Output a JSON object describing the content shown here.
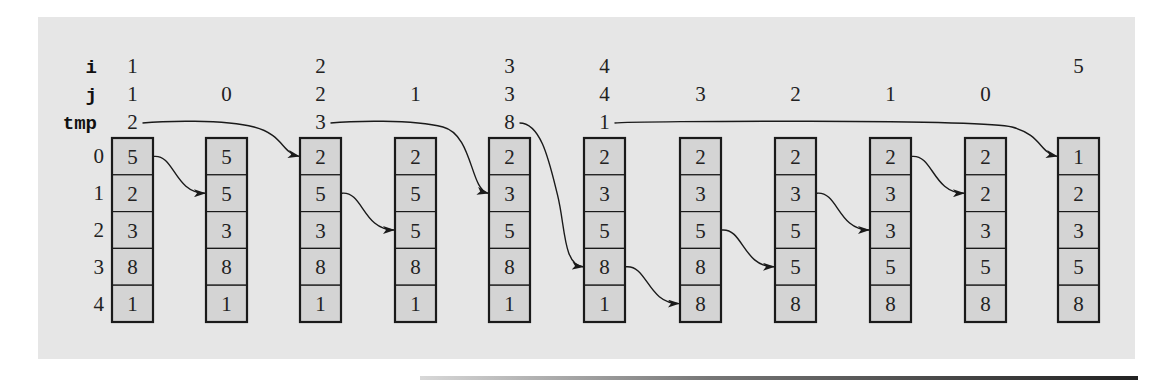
{
  "diagram": {
    "row_labels": {
      "i": "i",
      "j": "j",
      "tmp": "tmp"
    },
    "index_labels": [
      "0",
      "1",
      "2",
      "3",
      "4"
    ],
    "columns": [
      {
        "i": "1",
        "j": "1",
        "tmp": "2",
        "array": [
          "5",
          "2",
          "3",
          "8",
          "1"
        ]
      },
      {
        "i": "",
        "j": "0",
        "tmp": "",
        "array": [
          "5",
          "5",
          "3",
          "8",
          "1"
        ]
      },
      {
        "i": "2",
        "j": "2",
        "tmp": "3",
        "array": [
          "2",
          "5",
          "3",
          "8",
          "1"
        ]
      },
      {
        "i": "",
        "j": "1",
        "tmp": "",
        "array": [
          "2",
          "5",
          "5",
          "8",
          "1"
        ]
      },
      {
        "i": "3",
        "j": "3",
        "tmp": "8",
        "array": [
          "2",
          "3",
          "5",
          "8",
          "1"
        ]
      },
      {
        "i": "4",
        "j": "4",
        "tmp": "1",
        "array": [
          "2",
          "3",
          "5",
          "8",
          "1"
        ]
      },
      {
        "i": "",
        "j": "3",
        "tmp": "",
        "array": [
          "2",
          "3",
          "5",
          "8",
          "8"
        ]
      },
      {
        "i": "",
        "j": "2",
        "tmp": "",
        "array": [
          "2",
          "3",
          "5",
          "5",
          "8"
        ]
      },
      {
        "i": "",
        "j": "1",
        "tmp": "",
        "array": [
          "2",
          "3",
          "3",
          "5",
          "8"
        ]
      },
      {
        "i": "",
        "j": "0",
        "tmp": "",
        "array": [
          "2",
          "2",
          "3",
          "5",
          "8"
        ]
      },
      {
        "i": "5",
        "j": "",
        "tmp": "",
        "array": [
          "1",
          "2",
          "3",
          "5",
          "8"
        ]
      }
    ],
    "arrows": [
      {
        "from": "tmp",
        "from_col": 0,
        "to_col": 2,
        "to_row": 0
      },
      {
        "from": "cell",
        "from_col": 0,
        "from_row": 0,
        "to_col": 1,
        "to_row": 1
      },
      {
        "from": "tmp",
        "from_col": 2,
        "to_col": 4,
        "to_row": 1
      },
      {
        "from": "cell",
        "from_col": 2,
        "from_row": 1,
        "to_col": 3,
        "to_row": 2
      },
      {
        "from": "tmp",
        "from_col": 4,
        "to_col": 5,
        "to_row": 3
      },
      {
        "from": "cell",
        "from_col": 5,
        "from_row": 3,
        "to_col": 6,
        "to_row": 4
      },
      {
        "from": "cell",
        "from_col": 6,
        "from_row": 2,
        "to_col": 7,
        "to_row": 3
      },
      {
        "from": "cell",
        "from_col": 7,
        "from_row": 1,
        "to_col": 8,
        "to_row": 2
      },
      {
        "from": "cell",
        "from_col": 8,
        "from_row": 0,
        "to_col": 9,
        "to_row": 1
      },
      {
        "from": "tmp",
        "from_col": 5,
        "to_col": 10,
        "to_row": 0
      }
    ],
    "colors": {
      "panel": "#e6e6e6",
      "cell_fill": "#d4d4d4",
      "stroke": "#1a1a1a"
    }
  }
}
